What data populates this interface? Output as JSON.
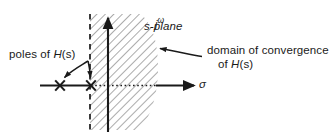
{
  "figure": {
    "axes": {
      "vertical_label": "jω",
      "vertical_label_parts": {
        "j": "j",
        "omega": "ω"
      },
      "horizontal_label": "σ"
    },
    "labels": {
      "plane": "s-plane",
      "poles": "poles of H(s)",
      "poles_parts": {
        "prefix": "poles of ",
        "func": "H",
        "arg": "(s)"
      },
      "domain_line1": "domain of convergence",
      "domain_line2": "of H(s)",
      "domain_line2_parts": {
        "prefix": "of ",
        "func": "H",
        "arg": "(s)"
      }
    },
    "markers": [
      {
        "name": "pole-1",
        "glyph": "x",
        "sigma_px": 60,
        "omega_px": 85
      },
      {
        "name": "pole-2",
        "glyph": "x",
        "sigma_px": 91,
        "omega_px": 85
      }
    ],
    "region": {
      "name": "domain-of-convergence",
      "fill": "hatch-45",
      "boundary": "vertical dashed line at sigma = pole-2, region to the right"
    },
    "colors": {
      "ink": "#1a1a1a",
      "hatch": "#5a5a5a",
      "background": "#ffffff"
    }
  }
}
